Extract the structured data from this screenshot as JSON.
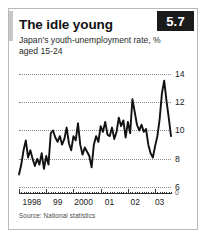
{
  "card": {
    "title": "The idle young",
    "subtitle_line1": "Japan’s youth-unemployment rate, %",
    "subtitle_line2": "aged 15-24",
    "badge": "5.7",
    "source": "Source: National statistics",
    "accent_color": "#1b1b1b",
    "line_color": "#111111",
    "grid_color": "#8a8a8a",
    "border_color": "#b9b9b9"
  },
  "chart_data": {
    "type": "line",
    "title": "The idle young",
    "subtitle": "Japan’s youth-unemployment rate, %, aged 15-24",
    "xlabel": "",
    "ylabel": "%",
    "ylim": [
      5.6,
      14.6
    ],
    "yticks": [
      6,
      8,
      10,
      12,
      14
    ],
    "ytick_labels": [
      "6",
      "8",
      "10",
      "12",
      "14"
    ],
    "zero_break_label": "0",
    "grid": true,
    "legend": null,
    "xlim": [
      "1998-01",
      "2003-10"
    ],
    "xtick_labels": [
      "1998",
      "99",
      "2000",
      "01",
      "02",
      "03"
    ],
    "xtick_positions": [
      0.085,
      0.255,
      0.425,
      0.595,
      0.765,
      0.925
    ],
    "series": [
      {
        "name": "Japan youth unemployment rate (15-24), %",
        "x": [
          "1998-01",
          "1998-02",
          "1998-03",
          "1998-04",
          "1998-05",
          "1998-06",
          "1998-07",
          "1998-08",
          "1998-09",
          "1998-10",
          "1998-11",
          "1998-12",
          "1999-01",
          "1999-02",
          "1999-03",
          "1999-04",
          "1999-05",
          "1999-06",
          "1999-07",
          "1999-08",
          "1999-09",
          "1999-10",
          "1999-11",
          "1999-12",
          "2000-01",
          "2000-02",
          "2000-03",
          "2000-04",
          "2000-05",
          "2000-06",
          "2000-07",
          "2000-08",
          "2000-09",
          "2000-10",
          "2000-11",
          "2000-12",
          "2001-01",
          "2001-02",
          "2001-03",
          "2001-04",
          "2001-05",
          "2001-06",
          "2001-07",
          "2001-08",
          "2001-09",
          "2001-10",
          "2001-11",
          "2001-12",
          "2002-01",
          "2002-02",
          "2002-03",
          "2002-04",
          "2002-05",
          "2002-06",
          "2002-07",
          "2002-08",
          "2002-09",
          "2002-10",
          "2002-11",
          "2002-12",
          "2003-01",
          "2003-02",
          "2003-03",
          "2003-04",
          "2003-05",
          "2003-06",
          "2003-07",
          "2003-08"
        ],
        "values": [
          6.9,
          7.6,
          8.6,
          9.3,
          8.1,
          8.6,
          8.0,
          7.5,
          8.0,
          7.6,
          8.4,
          7.3,
          8.2,
          7.6,
          9.8,
          10.0,
          9.5,
          9.2,
          9.6,
          9.0,
          9.4,
          10.2,
          9.1,
          8.6,
          9.6,
          9.3,
          10.5,
          9.0,
          8.3,
          8.8,
          8.5,
          8.2,
          7.4,
          9.0,
          9.6,
          9.2,
          10.3,
          9.9,
          10.6,
          9.7,
          9.6,
          10.2,
          9.4,
          9.9,
          10.9,
          10.3,
          10.7,
          9.5,
          10.6,
          9.8,
          12.2,
          11.3,
          10.4,
          10.0,
          10.4,
          9.9,
          10.1,
          9.0,
          8.4,
          8.1,
          8.9,
          9.6,
          10.8,
          12.6,
          13.5,
          12.1,
          10.9,
          9.6
        ]
      }
    ]
  }
}
